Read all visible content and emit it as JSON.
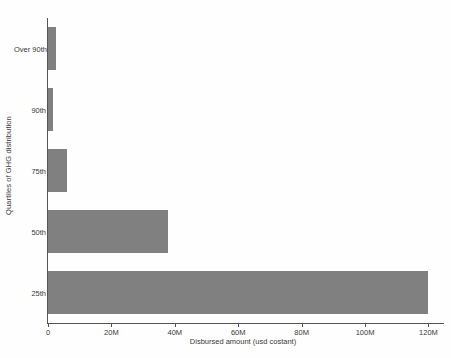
{
  "chart_data": {
    "type": "bar",
    "orientation": "horizontal",
    "title": "",
    "xlabel": "Disbursed amount (usd costant)",
    "ylabel": "Quartiles of GHG distribution",
    "categories": [
      "25th",
      "50th",
      "75th",
      "90th",
      "Over 90th"
    ],
    "values": [
      120000000,
      38000000,
      6000000,
      1500000,
      2500000
    ],
    "xlim": [
      0,
      123000000
    ],
    "xticks": [
      0,
      20000000,
      40000000,
      60000000,
      80000000,
      100000000,
      120000000
    ],
    "xtick_labels": [
      "0",
      "20M",
      "40M",
      "60M",
      "80M",
      "100M",
      "120M"
    ],
    "grid": false,
    "legend": null,
    "bar_color": "#808080",
    "background_color": "#fefefe",
    "axis_color": "#555555"
  }
}
